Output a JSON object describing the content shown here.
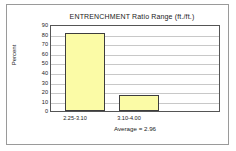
{
  "chart_data": {
    "type": "bar",
    "title": "ENTRENCHMENT  Ratio Range  (ft./ft.)",
    "xlabel": "",
    "ylabel": "Percent",
    "categories": [
      "2.25-3.10",
      "3.10-4.00"
    ],
    "values": [
      83,
      16.5
    ],
    "ylim": [
      0,
      90
    ],
    "yticks": [
      "90",
      "80",
      "70",
      "60",
      "50",
      "40",
      "30",
      "20",
      "10",
      "0"
    ],
    "grid": true,
    "legend": "none",
    "annotation": "Average =  2.96",
    "bar_fill_color": "#fbfba6",
    "bar_edge_color": "#3d3d3d",
    "grid_color": "#c8c8c8",
    "axes_color": "#555555",
    "frame_color": "#9a9a9a",
    "background_color": "#ffffff"
  }
}
